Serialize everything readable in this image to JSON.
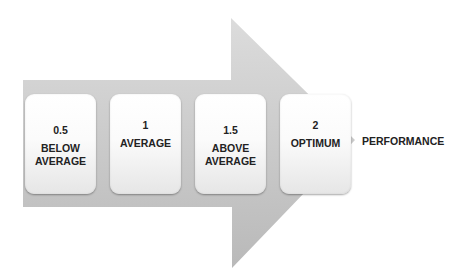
{
  "diagram": {
    "type": "arrow-process",
    "arrow_color": "#c8c8c8",
    "steps": [
      {
        "value": "0.5",
        "label": "BELOW\nAVERAGE"
      },
      {
        "value": "1",
        "label": "AVERAGE"
      },
      {
        "value": "1.5",
        "label": "ABOVE\nAVERAGE"
      },
      {
        "value": "2",
        "label": "OPTIMUM"
      }
    ],
    "end_label": "PERFORMANCE"
  }
}
